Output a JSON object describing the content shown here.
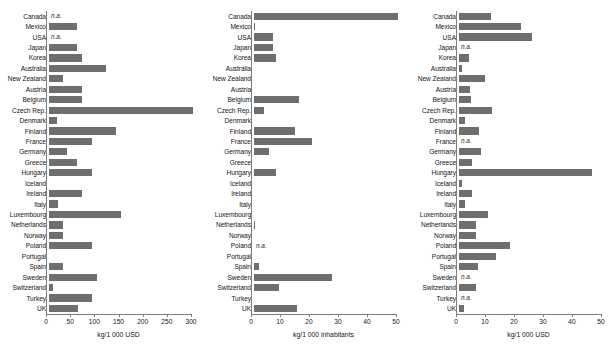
{
  "figure": {
    "title": "",
    "panel_count": 3
  },
  "chart_data": [
    {
      "type": "bar",
      "orientation": "horizontal",
      "title": "",
      "xlabel": "kg/1 000 USD",
      "ylabel": "",
      "xlim": [
        0,
        300
      ],
      "ticks": [
        0,
        50,
        100,
        150,
        200,
        250,
        300
      ],
      "tick_labels": [
        "0",
        "50",
        "100",
        "150",
        "200",
        "250",
        "300"
      ],
      "grid": false,
      "legend": null,
      "bar_color": "#6e6e6e",
      "na_text": "n.a.",
      "categories": [
        "Canada",
        "Mexico",
        "USA",
        "Japan",
        "Korea",
        "Australia",
        "New Zealand",
        "Austria",
        "Belgium",
        "Czech Rep.",
        "Denmark",
        "Finland",
        "France",
        "Germany",
        "Greece",
        "Hungary",
        "Iceland",
        "Ireland",
        "Italy",
        "Luxembourg",
        "Netherlands",
        "Norway",
        "Poland",
        "Portugal",
        "Spain",
        "Sweden",
        "Switzerland",
        "Turkey",
        "UK"
      ],
      "values": [
        null,
        57,
        null,
        57,
        68,
        118,
        28,
        68,
        68,
        297,
        17,
        139,
        88,
        38,
        58,
        88,
        0,
        69,
        19,
        149,
        29,
        29,
        89,
        0,
        29,
        99,
        9,
        89,
        60
      ]
    },
    {
      "type": "bar",
      "orientation": "horizontal",
      "title": "",
      "xlabel": "kg/1 000  inhabitants",
      "ylabel": "",
      "xlim": [
        0,
        50
      ],
      "ticks": [
        0,
        10,
        20,
        30,
        40,
        50
      ],
      "tick_labels": [
        "0",
        "10",
        "20",
        "30",
        "40",
        "50"
      ],
      "grid": false,
      "legend": null,
      "bar_color": "#6e6e6e",
      "na_text": "n.a.",
      "categories": [
        "Canada",
        "Mexico",
        "USA",
        "Japan",
        "Korea",
        "Australia",
        "New Zealand",
        "Austria",
        "Belgium",
        "Czech Rep.",
        "Denmark",
        "Finland",
        "France",
        "Germany",
        "Greece",
        "Hungary",
        "Iceland",
        "Ireland",
        "Italy",
        "Luxembourg",
        "Netherlands",
        "Norway",
        "Poland",
        "Portugal",
        "Spain",
        "Sweden",
        "Switzerland",
        "Turkey",
        "UK"
      ],
      "values": [
        49.5,
        0.2,
        6.5,
        6.5,
        7.5,
        0,
        0,
        0,
        15.5,
        3.5,
        0,
        14,
        20,
        5,
        0,
        7.5,
        0,
        0,
        0,
        0,
        0.5,
        0,
        null,
        0,
        1.8,
        27,
        8.5,
        0,
        14.8
      ]
    },
    {
      "type": "bar",
      "orientation": "horizontal",
      "title": "",
      "xlabel": "kg/1 000 USD",
      "ylabel": "",
      "xlim": [
        0,
        50
      ],
      "ticks": [
        0,
        10,
        20,
        30,
        40,
        50
      ],
      "tick_labels": [
        "0",
        "10",
        "20",
        "30",
        "40",
        "50"
      ],
      "grid": false,
      "legend": null,
      "bar_color": "#6e6e6e",
      "na_text": "n.a.",
      "categories": [
        "Canada",
        "Mexico",
        "USA",
        "Japan",
        "Korea",
        "Australia",
        "New Zealand",
        "Austria",
        "Belgium",
        "Czech Rep.",
        "Denmark",
        "Finland",
        "France",
        "Germany",
        "Greece",
        "Hungary",
        "Iceland",
        "Ireland",
        "Italy",
        "Luxembourg",
        "Netherlands",
        "Norway",
        "Poland",
        "Portugal",
        "Spain",
        "Sweden",
        "Switzerland",
        "Turkey",
        "UK"
      ],
      "values": [
        11,
        21.5,
        25,
        null,
        3.5,
        1.2,
        9,
        3.8,
        4.2,
        11.5,
        2,
        7,
        null,
        7.5,
        4.5,
        46,
        1,
        4.5,
        2.2,
        10,
        5.8,
        5.8,
        17.5,
        12.8,
        6.5,
        null,
        6,
        null,
        1.8
      ]
    }
  ]
}
